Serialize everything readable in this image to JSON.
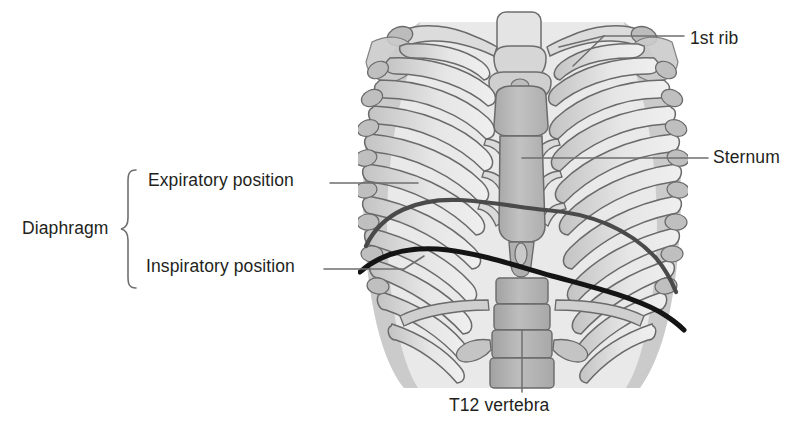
{
  "figure": {
    "width": 804,
    "height": 433,
    "background": "#ffffff"
  },
  "labels": {
    "first_rib": "1st rib",
    "sternum": "Sternum",
    "expiratory_position": "Expiratory position",
    "diaphragm": "Diaphragm",
    "inspiratory_position": "Inspiratory position",
    "t12_vertebra": "T12 vertebra"
  },
  "grouping": {
    "brace_label": "Diaphragm",
    "brace_members": [
      "Expiratory position",
      "Inspiratory position"
    ]
  },
  "colors": {
    "text": "#231f20",
    "leader_line": "#6f6f6f",
    "brace": "#6f6f6f",
    "bone_fill_light": "#ececec",
    "bone_fill_mid": "#d4d4d4",
    "bone_fill_dark": "#bdbdbd",
    "sternum_fill": "#b9b9b9",
    "vertebra_fill": "#b4b4b4",
    "bone_outline": "#6a6a6a",
    "expiratory_curve": "#4a4a4a",
    "inspiratory_curve": "#141414",
    "background": "#ffffff"
  },
  "anatomy": {
    "structures": [
      "1st rib",
      "Sternum",
      "T12 vertebra",
      "Diaphragm expiratory position",
      "Diaphragm inspiratory position",
      "Clavicles",
      "Costal cartilages",
      "Thoracic vertebrae",
      "Ribs"
    ]
  }
}
